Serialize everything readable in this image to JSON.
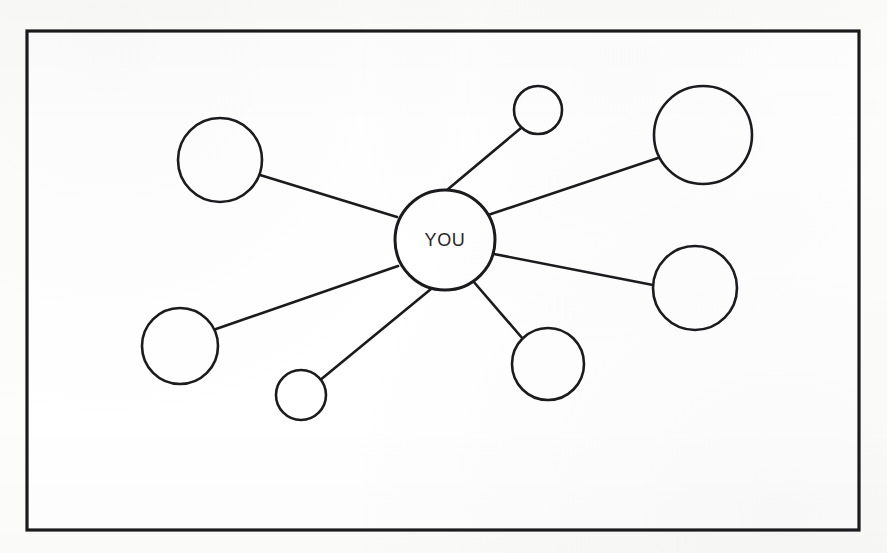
{
  "document": {
    "type": "hand-drawn network diagram",
    "background_color": "#fdfdfb",
    "ink_color": "#1b1b1e",
    "frame": {
      "name": "outer-frame",
      "x": 27,
      "y": 31,
      "width": 832,
      "height": 499,
      "stroke_width": 3.2,
      "fill": "#ffffff"
    }
  },
  "chart_data": {
    "type": "diagram",
    "title": "",
    "layout": "radial hub-and-spoke",
    "center_node": {
      "id": "you",
      "label": "YOU",
      "cx": 445,
      "cy": 240,
      "r": 50,
      "stroke_width": 3.0
    },
    "nodes": [
      {
        "id": "node-top-left",
        "label": "",
        "cx": 220,
        "cy": 160,
        "r": 42,
        "stroke_width": 2.6,
        "size": "large"
      },
      {
        "id": "node-top-small",
        "label": "",
        "cx": 538,
        "cy": 110,
        "r": 24,
        "stroke_width": 2.6,
        "size": "small"
      },
      {
        "id": "node-top-right",
        "label": "",
        "cx": 703,
        "cy": 135,
        "r": 49,
        "stroke_width": 2.6,
        "size": "large"
      },
      {
        "id": "node-right",
        "label": "",
        "cx": 695,
        "cy": 288,
        "r": 42,
        "stroke_width": 2.6,
        "size": "large"
      },
      {
        "id": "node-bottom-right",
        "label": "",
        "cx": 548,
        "cy": 364,
        "r": 36,
        "stroke_width": 2.6,
        "size": "medium"
      },
      {
        "id": "node-bottom-small",
        "label": "",
        "cx": 301,
        "cy": 395,
        "r": 25,
        "stroke_width": 2.6,
        "size": "small"
      },
      {
        "id": "node-left",
        "label": "",
        "cx": 180,
        "cy": 346,
        "r": 38,
        "stroke_width": 2.6,
        "size": "medium"
      }
    ],
    "edges": [
      {
        "id": "edge-you-top-left",
        "from": "you",
        "to": "node-top-left",
        "x1": 397,
        "y1": 217,
        "x2": 260,
        "y2": 175,
        "stroke_width": 2.6
      },
      {
        "id": "edge-you-top-small",
        "from": "you",
        "to": "node-top-small",
        "x1": 447,
        "y1": 190,
        "x2": 521,
        "y2": 128,
        "stroke_width": 2.6
      },
      {
        "id": "edge-you-top-right",
        "from": "you",
        "to": "node-top-right",
        "x1": 488,
        "y1": 215,
        "x2": 658,
        "y2": 158,
        "stroke_width": 2.6
      },
      {
        "id": "edge-you-right",
        "from": "you",
        "to": "node-right",
        "x1": 494,
        "y1": 254,
        "x2": 653,
        "y2": 285,
        "stroke_width": 2.6
      },
      {
        "id": "edge-you-bottom-right",
        "from": "you",
        "to": "node-bottom-right",
        "x1": 473,
        "y1": 281,
        "x2": 523,
        "y2": 339,
        "stroke_width": 2.6
      },
      {
        "id": "edge-you-bottom-small",
        "from": "you",
        "to": "node-bottom-small",
        "x1": 431,
        "y1": 289,
        "x2": 319,
        "y2": 381,
        "stroke_width": 2.6
      },
      {
        "id": "edge-you-left",
        "from": "you",
        "to": "node-left",
        "x1": 398,
        "y1": 266,
        "x2": 216,
        "y2": 329,
        "stroke_width": 2.6
      }
    ],
    "node_count": 8,
    "edge_count": 7,
    "legend": [],
    "annotations": []
  }
}
